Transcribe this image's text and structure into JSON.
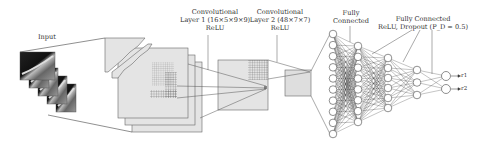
{
  "diagram": {
    "type": "cnn-architecture",
    "labels": {
      "input": "Input",
      "conv1": {
        "line1": "Convolutional",
        "line2": "Layer 1 (16×5×9×9)",
        "line3": "ReLU"
      },
      "conv2": {
        "line1": "Convolutional",
        "line2": "Layer 2 (48×7×7)",
        "line3": "ReLU"
      },
      "fc1": {
        "line1": "Fully",
        "line2": "Connected"
      },
      "fc2": {
        "line1": "Fully Connected",
        "line2": "ReLU, Dropout (P_D = 0.5)"
      }
    },
    "outputs": [
      "r1",
      "r2"
    ],
    "output_labels": [
      "→r₁",
      "→r₂"
    ],
    "input_frames": 5,
    "conv1_maps": 3,
    "fc_layers": [
      {
        "x": 333,
        "neurons": 10,
        "y_top": 34,
        "y_bottom": 134
      },
      {
        "x": 358,
        "neurons": 8,
        "y_top": 46,
        "y_bottom": 122
      },
      {
        "x": 388,
        "neurons": 6,
        "y_top": 58,
        "y_bottom": 108
      },
      {
        "x": 417,
        "neurons": 3,
        "y_top": 70,
        "y_bottom": 95
      },
      {
        "x": 446,
        "neurons": 2,
        "y_top": 76,
        "y_bottom": 89
      }
    ],
    "colors": {
      "map_fill": "#e2e2e2",
      "stroke": "#555555",
      "grid": "#777777",
      "neuron_fill": "#ffffff",
      "edge": "#3a3a3a"
    }
  }
}
